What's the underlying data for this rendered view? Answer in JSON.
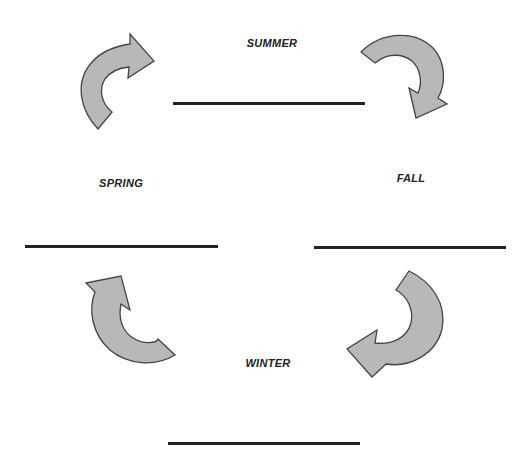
{
  "diagram": {
    "title": "",
    "type": "cycle",
    "colors": {
      "arrow_fill": "#b8b8b8",
      "arrow_stroke": "#444444",
      "line": "#222222",
      "text": "#222222"
    },
    "seasons": [
      {
        "name": "SUMMER",
        "label_x": 272,
        "label_y": 40,
        "line": {
          "x1": 173,
          "x2": 365,
          "y": 103
        }
      },
      {
        "name": "SPRING",
        "label_x": 121,
        "label_y": 179,
        "line": {
          "x1": 25,
          "x2": 218,
          "y": 246
        }
      },
      {
        "name": "FALL",
        "label_x": 411,
        "label_y": 174,
        "line": {
          "x1": 314,
          "x2": 506,
          "y": 247
        }
      },
      {
        "name": "WINTER",
        "label_x": 268,
        "label_y": 357,
        "line": {
          "x1": 168,
          "x2": 360,
          "y": 443
        }
      }
    ],
    "arrows": [
      {
        "position": "top-left",
        "direction": "clockwise",
        "points_to": "right"
      },
      {
        "position": "top-right",
        "direction": "clockwise",
        "points_to": "down"
      },
      {
        "position": "bottom-right",
        "direction": "clockwise",
        "points_to": "left"
      },
      {
        "position": "bottom-left",
        "direction": "clockwise",
        "points_to": "up"
      }
    ]
  }
}
